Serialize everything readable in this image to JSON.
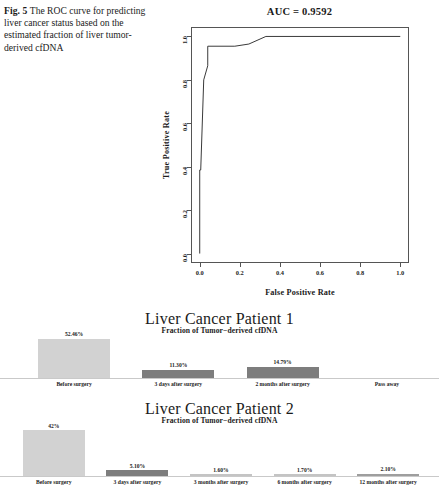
{
  "caption": {
    "figure_label": "Fig. 5",
    "text": "The ROC curve for predicting liver cancer status based on the estimated fraction of liver tumor-derived cfDNA"
  },
  "roc": {
    "title": "AUC = 0.9592",
    "xlabel": "False Positive Rate",
    "ylabel": "True Positive Rate"
  },
  "chart_data": [
    {
      "type": "line",
      "name": "roc-curve",
      "title": "AUC = 0.9592",
      "xlabel": "False Positive Rate",
      "ylabel": "True Positive Rate",
      "xlim": [
        0.0,
        1.0
      ],
      "ylim": [
        0.0,
        1.0
      ],
      "xticks": [
        "0.0",
        "0.2",
        "0.4",
        "0.6",
        "0.8",
        "1.0"
      ],
      "yticks": [
        "0.0",
        "0.2",
        "0.4",
        "0.6",
        "0.8",
        "1.0"
      ],
      "xtick_values": [
        0.0,
        0.2,
        0.4,
        0.6,
        0.8,
        1.0
      ],
      "ytick_values": [
        0.0,
        0.2,
        0.4,
        0.6,
        0.8,
        1.0
      ],
      "grid": false,
      "legend": null,
      "auc": 0.9592,
      "x": [
        0.0,
        0.0,
        0.005,
        0.02,
        0.04,
        0.04,
        0.175,
        0.245,
        0.33,
        0.33,
        1.0
      ],
      "y": [
        0.0,
        0.385,
        0.385,
        0.8,
        0.865,
        0.955,
        0.955,
        0.965,
        1.0,
        1.0,
        1.0
      ]
    },
    {
      "type": "bar",
      "name": "liver-cancer-patient-1",
      "title": "Liver Cancer Patient 1",
      "subtitle": "Fraction of Tumor−derived cfDNA",
      "categories": [
        "Before surgery",
        "3 days after surgery",
        "2 months after surgery",
        "Pass away"
      ],
      "values": [
        52.46,
        11.3,
        14.79,
        0
      ],
      "value_labels": [
        "52.46%",
        "11.30%",
        "14.79%",
        ""
      ],
      "colors": [
        "#d2d2d2",
        "#7d7d7d",
        "#7d7d7d",
        "#c9c9c9"
      ],
      "ylabel": "",
      "xlabel": ""
    },
    {
      "type": "bar",
      "name": "liver-cancer-patient-2",
      "title": "Liver Cancer Patient 2",
      "subtitle": "Fraction of Tumor−derived cfDNA",
      "categories": [
        "Before surgery",
        "3 days after surgery",
        "3 months after surgery",
        "6 months after surgery",
        "12 months after surgery"
      ],
      "values": [
        42.0,
        5.1,
        1.6,
        1.7,
        2.1
      ],
      "value_labels": [
        "42%",
        "5.10%",
        "1.60%",
        "1.70%",
        "2.10%"
      ],
      "colors": [
        "#d2d2d2",
        "#7d7d7d",
        "#c4c4c4",
        "#c4c4c4",
        "#9e9e9e"
      ],
      "ylabel": "",
      "xlabel": ""
    }
  ]
}
